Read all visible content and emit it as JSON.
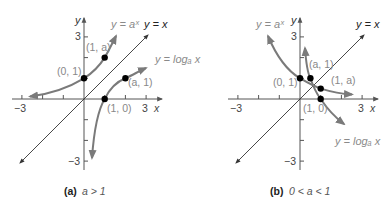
{
  "panels": [
    {
      "id": "a",
      "caption_label": "(a)",
      "caption_condition": "a > 1",
      "axis_x_label": "x",
      "axis_y_label": "y",
      "ticks": {
        "x_neg": "−3",
        "x_pos": "3",
        "y_pos": "3",
        "y_neg": "−3"
      },
      "curve_labels": {
        "exp": "y = aˣ",
        "identity": "y = x",
        "log": "y = logₐ x"
      },
      "points": [
        {
          "label": "(0, 1)"
        },
        {
          "label": "(1, a)"
        },
        {
          "label": "(a, 1)"
        },
        {
          "label": "(1, 0)"
        }
      ]
    },
    {
      "id": "b",
      "caption_label": "(b)",
      "caption_condition": "0 < a < 1",
      "axis_x_label": "x",
      "axis_y_label": "y",
      "ticks": {
        "x_neg": "−3",
        "x_pos": "3",
        "y_pos": "3",
        "y_neg": "−3"
      },
      "curve_labels": {
        "exp": "y = aˣ",
        "identity": "y = x",
        "log": "y = logₐ x"
      },
      "points": [
        {
          "label": "(0, 1)"
        },
        {
          "label": "(a, 1)"
        },
        {
          "label": "(1, a)"
        },
        {
          "label": "(1, 0)"
        }
      ]
    }
  ],
  "colors": {
    "curve": "#7a7a7a",
    "axis": "#555555",
    "point": "#000000"
  }
}
